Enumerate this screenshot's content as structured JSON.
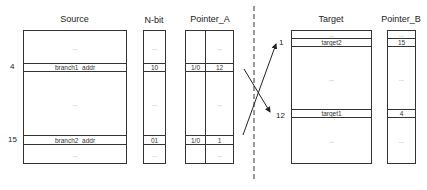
{
  "source": {
    "title": "Source",
    "rows": [
      {
        "label": "...",
        "index": ""
      },
      {
        "label": "branch1_addr",
        "index": "4"
      },
      {
        "label": "...",
        "index": ""
      },
      {
        "label": "branch2_addr",
        "index": "15"
      },
      {
        "label": "...",
        "index": ""
      }
    ]
  },
  "nbit": {
    "title": "N-bit",
    "rows": [
      "...",
      "10",
      "...",
      "01",
      "..."
    ]
  },
  "pointer_a": {
    "title": "Pointer_A",
    "left": [
      "",
      "1/0",
      "",
      "1/0",
      ""
    ],
    "right": [
      "...",
      "12",
      "...",
      "1",
      "..."
    ]
  },
  "target": {
    "title": "Target",
    "rows": [
      {
        "label": "...",
        "index": ""
      },
      {
        "label": "target2",
        "index": "1"
      },
      {
        "label": "...",
        "index": ""
      },
      {
        "label": "target1",
        "index": "12"
      },
      {
        "label": "...",
        "index": ""
      }
    ]
  },
  "pointer_b": {
    "title": "Pointer_B",
    "rows": [
      "...",
      "15",
      "...",
      "4",
      "..."
    ]
  },
  "colors": {
    "line": "#333333",
    "text": "#222222",
    "dots": "#777777"
  }
}
